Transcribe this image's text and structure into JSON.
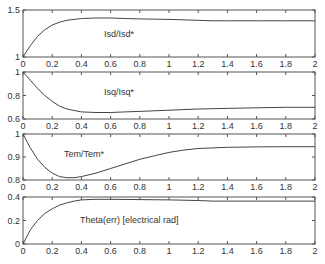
{
  "chart_data": [
    {
      "type": "line",
      "title": "",
      "annotation": "Isd/Isd*",
      "xlabel": "",
      "ylabel": "",
      "xlim": [
        0,
        2
      ],
      "ylim": [
        1,
        1.5
      ],
      "xticks": [
        "0",
        "0.2",
        "0.4",
        "0.6",
        "0.8",
        "1",
        "1.2",
        "1.4",
        "1.6",
        "1.8",
        "2"
      ],
      "yticks": [
        "1",
        "1.5"
      ],
      "grid": false,
      "x": [
        0,
        0.05,
        0.1,
        0.15,
        0.2,
        0.25,
        0.3,
        0.4,
        0.5,
        0.6,
        0.7,
        0.8,
        1.0,
        1.2,
        1.3,
        1.4,
        1.6,
        1.8,
        2.0
      ],
      "values": [
        1.0,
        1.12,
        1.22,
        1.29,
        1.34,
        1.37,
        1.39,
        1.41,
        1.415,
        1.415,
        1.41,
        1.405,
        1.4,
        1.39,
        1.385,
        1.385,
        1.385,
        1.385,
        1.385
      ]
    },
    {
      "type": "line",
      "title": "",
      "annotation": "Isq/Isq*",
      "xlabel": "",
      "ylabel": "",
      "xlim": [
        0,
        2
      ],
      "ylim": [
        0.6,
        1
      ],
      "xticks": [
        "0",
        "0.2",
        "0.4",
        "0.6",
        "0.8",
        "1",
        "1.2",
        "1.4",
        "1.6",
        "1.8",
        "2"
      ],
      "yticks": [
        "0.6",
        "0.8",
        "1"
      ],
      "grid": false,
      "x": [
        0,
        0.05,
        0.1,
        0.15,
        0.2,
        0.25,
        0.3,
        0.4,
        0.5,
        0.6,
        0.7,
        0.8,
        1.0,
        1.2,
        1.4,
        1.6,
        1.8,
        2.0
      ],
      "values": [
        1.0,
        0.93,
        0.86,
        0.8,
        0.75,
        0.71,
        0.685,
        0.66,
        0.655,
        0.655,
        0.66,
        0.665,
        0.675,
        0.685,
        0.69,
        0.695,
        0.7,
        0.7
      ]
    },
    {
      "type": "line",
      "title": "",
      "annotation": "Tem/Tem*",
      "xlabel": "",
      "ylabel": "",
      "xlim": [
        0,
        2
      ],
      "ylim": [
        0.8,
        1
      ],
      "xticks": [
        "0",
        "0.2",
        "0.4",
        "0.6",
        "0.8",
        "1",
        "1.2",
        "1.4",
        "1.6",
        "1.8",
        "2"
      ],
      "yticks": [
        "0.8",
        "0.9",
        "1"
      ],
      "grid": false,
      "x": [
        0,
        0.05,
        0.1,
        0.15,
        0.2,
        0.25,
        0.3,
        0.35,
        0.4,
        0.5,
        0.6,
        0.7,
        0.8,
        0.9,
        1.0,
        1.1,
        1.2,
        1.4,
        1.6,
        1.8,
        2.0
      ],
      "values": [
        1.0,
        0.94,
        0.89,
        0.855,
        0.83,
        0.815,
        0.81,
        0.81,
        0.815,
        0.83,
        0.85,
        0.87,
        0.89,
        0.905,
        0.92,
        0.93,
        0.937,
        0.942,
        0.944,
        0.945,
        0.945
      ]
    },
    {
      "type": "line",
      "title": "",
      "annotation": "Theta(err) [electrical rad]",
      "xlabel": "",
      "ylabel": "",
      "xlim": [
        0,
        2
      ],
      "ylim": [
        0,
        0.4
      ],
      "xticks": [
        "0",
        "0.2",
        "0.4",
        "0.6",
        "0.8",
        "1",
        "1.2",
        "1.4",
        "1.6",
        "1.8",
        "2"
      ],
      "yticks": [
        "0",
        "0.2",
        "0.4"
      ],
      "grid": false,
      "x": [
        0,
        0.05,
        0.1,
        0.15,
        0.2,
        0.25,
        0.3,
        0.35,
        0.4,
        0.5,
        0.6,
        0.8,
        1.0,
        1.2,
        1.3,
        1.4,
        1.6,
        1.8,
        2.0
      ],
      "values": [
        0.0,
        0.12,
        0.2,
        0.26,
        0.3,
        0.33,
        0.35,
        0.365,
        0.375,
        0.38,
        0.38,
        0.378,
        0.375,
        0.37,
        0.365,
        0.365,
        0.365,
        0.365,
        0.365
      ]
    }
  ]
}
